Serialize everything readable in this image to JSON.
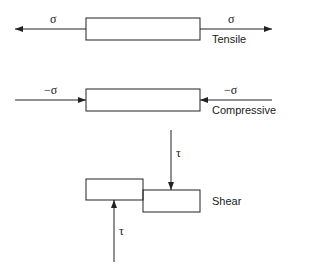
{
  "diagram": {
    "tensile": {
      "left_symbol": "σ",
      "right_symbol": "σ",
      "label": "Tensile"
    },
    "compressive": {
      "left_symbol": "−σ",
      "right_symbol": "−σ",
      "label": "Compressive"
    },
    "shear": {
      "top_symbol": "τ",
      "bottom_symbol": "τ",
      "label": "Shear"
    },
    "colors": {
      "stroke": "#222222",
      "background": "#ffffff"
    }
  }
}
